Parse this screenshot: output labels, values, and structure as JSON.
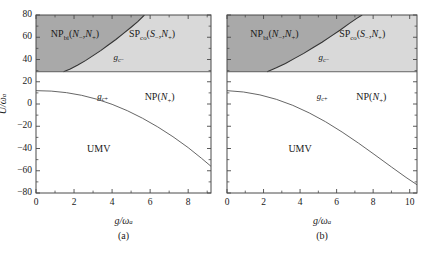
{
  "figure": {
    "panels": [
      {
        "caption": "(a)",
        "xlabel_num": "g",
        "xlabel_den": "ω",
        "xlabel_den_sub": "a",
        "ylabel_num": "U",
        "ylabel_den": "ω",
        "ylabel_den_sub": "a",
        "x_ticks": [
          0,
          2,
          4,
          6,
          8
        ],
        "x_minor_step": 1,
        "xlim": [
          0,
          9.2
        ],
        "y_ticks": [
          -80,
          -60,
          -40,
          -20,
          0,
          20,
          40,
          60,
          80
        ],
        "ylim": [
          -80,
          80
        ],
        "regions": [
          {
            "name": "NP-bi",
            "label_main": "NP",
            "label_sub": "bi",
            "label_args": "(N−,N+)",
            "x": 2.05,
            "y": 62,
            "fill": "#a9a9a9"
          },
          {
            "name": "SP-co",
            "label_main": "SP",
            "label_sub": "co",
            "label_args": "(S−,N+)",
            "x": 6.1,
            "y": 62,
            "fill": "#d9d9d9"
          },
          {
            "name": "NP",
            "label_main": "NP",
            "label_sub": "",
            "label_args": "(N+)",
            "x": 6.5,
            "y": 5,
            "fill": "#ffffff"
          },
          {
            "name": "UMV",
            "label_main": "UMV",
            "label_sub": "",
            "label_args": "",
            "x": 3.3,
            "y": -40,
            "fill": "#ffffff"
          }
        ],
        "curve_labels": [
          {
            "name": "g-c-minus",
            "text": "g",
            "sub": "c−",
            "x": 4.35,
            "y": 41
          },
          {
            "name": "g-c-plus",
            "text": "g",
            "sub": "c+",
            "x": 3.5,
            "y": 6
          }
        ],
        "horizontal_boundary_y": 29,
        "gc_minus_curve": [
          [
            1.45,
            29
          ],
          [
            1.8,
            31.5
          ],
          [
            2.2,
            35
          ],
          [
            2.6,
            39
          ],
          [
            3.0,
            43.5
          ],
          [
            3.4,
            48
          ],
          [
            3.8,
            53
          ],
          [
            4.2,
            58
          ],
          [
            4.6,
            63.5
          ],
          [
            5.0,
            69
          ],
          [
            5.35,
            74
          ],
          [
            5.7,
            80
          ]
        ],
        "gc_plus_curve": [
          [
            0.0,
            12
          ],
          [
            0.8,
            11.6
          ],
          [
            1.6,
            10.2
          ],
          [
            2.4,
            7.8
          ],
          [
            3.2,
            4.3
          ],
          [
            4.0,
            -0.3
          ],
          [
            4.8,
            -6
          ],
          [
            5.6,
            -12.8
          ],
          [
            6.4,
            -20.6
          ],
          [
            7.2,
            -29.4
          ],
          [
            8.0,
            -39.2
          ],
          [
            8.7,
            -48.8
          ],
          [
            9.2,
            -56
          ]
        ]
      },
      {
        "caption": "(b)",
        "xlabel_num": "g",
        "xlabel_den": "ω",
        "xlabel_den_sub": "a",
        "ylabel_num": "U",
        "ylabel_den": "ω",
        "ylabel_den_sub": "a",
        "x_ticks": [
          0,
          2,
          4,
          6,
          8,
          10
        ],
        "x_minor_step": 1,
        "xlim": [
          0,
          10.4
        ],
        "y_ticks": [
          -80,
          -60,
          -40,
          -20,
          0,
          20,
          40,
          60,
          80
        ],
        "ylim": [
          -80,
          80
        ],
        "regions": [
          {
            "name": "NP-bi",
            "label_main": "NP",
            "label_sub": "bi",
            "label_args": "(N−,N+)",
            "x": 2.6,
            "y": 62,
            "fill": "#a9a9a9"
          },
          {
            "name": "SP-co",
            "label_main": "SP",
            "label_sub": "co",
            "label_args": "(S−,N+)",
            "x": 7.4,
            "y": 62,
            "fill": "#d9d9d9"
          },
          {
            "name": "NP",
            "label_main": "NP",
            "label_sub": "",
            "label_args": "(N+)",
            "x": 7.9,
            "y": 5,
            "fill": "#ffffff"
          },
          {
            "name": "UMV",
            "label_main": "UMV",
            "label_sub": "",
            "label_args": "",
            "x": 4.0,
            "y": -40,
            "fill": "#ffffff"
          }
        ],
        "curve_labels": [
          {
            "name": "g-c-minus",
            "text": "g",
            "sub": "c−",
            "x": 5.3,
            "y": 41
          },
          {
            "name": "g-c-plus",
            "text": "g",
            "sub": "c+",
            "x": 5.2,
            "y": 6
          }
        ],
        "horizontal_boundary_y": 29,
        "gc_minus_curve": [
          [
            2.2,
            29
          ],
          [
            2.7,
            32.5
          ],
          [
            3.2,
            36.5
          ],
          [
            3.7,
            41
          ],
          [
            4.2,
            45.5
          ],
          [
            4.7,
            50.5
          ],
          [
            5.2,
            55.5
          ],
          [
            5.7,
            61
          ],
          [
            6.2,
            66.5
          ],
          [
            6.7,
            72.5
          ],
          [
            7.1,
            77
          ],
          [
            7.4,
            80
          ]
        ],
        "gc_plus_curve": [
          [
            0.0,
            12
          ],
          [
            0.9,
            10.8
          ],
          [
            1.8,
            8.2
          ],
          [
            2.7,
            4.2
          ],
          [
            3.6,
            -1.2
          ],
          [
            4.5,
            -8
          ],
          [
            5.4,
            -16
          ],
          [
            6.3,
            -25.2
          ],
          [
            7.2,
            -35.2
          ],
          [
            8.1,
            -45.8
          ],
          [
            9.0,
            -56.6
          ],
          [
            9.8,
            -66
          ],
          [
            10.4,
            -72.6
          ]
        ]
      }
    ],
    "style": {
      "dark_fill": "#a9a9a9",
      "light_fill": "#d9d9d9",
      "white_fill": "#ffffff",
      "axis_color": "#4a4a4a",
      "curve_color": "#555555"
    }
  }
}
